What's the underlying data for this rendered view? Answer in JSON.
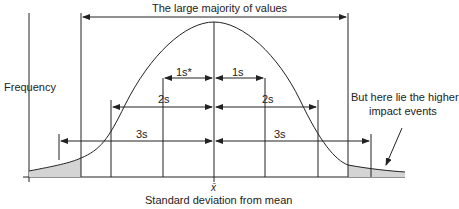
{
  "title": "The large majority of values",
  "y_axis_label": "Frequency",
  "x_axis_label": "Standard deviation from mean",
  "mean_symbol": "x̄",
  "spans": {
    "one_left": "1s*",
    "one_right": "1s",
    "two_left": "2s",
    "two_right": "2s",
    "three_left": "3s",
    "three_right": "3s"
  },
  "annotation": {
    "line1": "But here lie the higher",
    "line2": "impact events"
  },
  "colors": {
    "line": "#222222",
    "tail_fill": "#d4d4d4"
  }
}
